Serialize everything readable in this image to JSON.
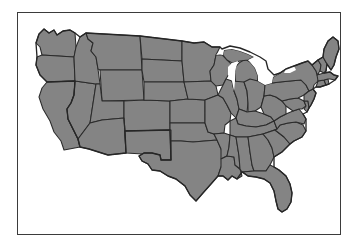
{
  "figure": {
    "kind": "map-figure",
    "background_color": "#ffffff",
    "width": 358,
    "height": 247,
    "caption": "",
    "title": ""
  },
  "frame": {
    "name": "map-border-frame",
    "border_color": "#3b3b3b",
    "border_width_px": 1.4,
    "fill_color": "#ffffff",
    "left_px": 17,
    "top_px": 12,
    "width_px": 324,
    "height_px": 223
  },
  "map": {
    "name": "united-states-map",
    "region": "Contiguous United States",
    "projection_look": "albers-like",
    "land_fill_color": "#848484",
    "state_border_color": "#2b2b2b",
    "outline_color": "#262626",
    "water_fill_color": "#ffffff",
    "labels_visible": false,
    "legend_visible": false,
    "state_count": 48,
    "states": [
      {
        "code": "WA",
        "name": "Washington"
      },
      {
        "code": "OR",
        "name": "Oregon"
      },
      {
        "code": "CA",
        "name": "California"
      },
      {
        "code": "NV",
        "name": "Nevada"
      },
      {
        "code": "ID",
        "name": "Idaho"
      },
      {
        "code": "MT",
        "name": "Montana"
      },
      {
        "code": "WY",
        "name": "Wyoming"
      },
      {
        "code": "UT",
        "name": "Utah"
      },
      {
        "code": "AZ",
        "name": "Arizona"
      },
      {
        "code": "CO",
        "name": "Colorado"
      },
      {
        "code": "NM",
        "name": "New Mexico"
      },
      {
        "code": "ND",
        "name": "North Dakota"
      },
      {
        "code": "SD",
        "name": "South Dakota"
      },
      {
        "code": "NE",
        "name": "Nebraska"
      },
      {
        "code": "KS",
        "name": "Kansas"
      },
      {
        "code": "OK",
        "name": "Oklahoma"
      },
      {
        "code": "TX",
        "name": "Texas"
      },
      {
        "code": "MN",
        "name": "Minnesota"
      },
      {
        "code": "IA",
        "name": "Iowa"
      },
      {
        "code": "MO",
        "name": "Missouri"
      },
      {
        "code": "AR",
        "name": "Arkansas"
      },
      {
        "code": "LA",
        "name": "Louisiana"
      },
      {
        "code": "WI",
        "name": "Wisconsin"
      },
      {
        "code": "IL",
        "name": "Illinois"
      },
      {
        "code": "MI",
        "name": "Michigan"
      },
      {
        "code": "IN",
        "name": "Indiana"
      },
      {
        "code": "OH",
        "name": "Ohio"
      },
      {
        "code": "KY",
        "name": "Kentucky"
      },
      {
        "code": "TN",
        "name": "Tennessee"
      },
      {
        "code": "MS",
        "name": "Mississippi"
      },
      {
        "code": "AL",
        "name": "Alabama"
      },
      {
        "code": "GA",
        "name": "Georgia"
      },
      {
        "code": "FL",
        "name": "Florida"
      },
      {
        "code": "SC",
        "name": "South Carolina"
      },
      {
        "code": "NC",
        "name": "North Carolina"
      },
      {
        "code": "VA",
        "name": "Virginia"
      },
      {
        "code": "WV",
        "name": "West Virginia"
      },
      {
        "code": "MD",
        "name": "Maryland"
      },
      {
        "code": "DE",
        "name": "Delaware"
      },
      {
        "code": "PA",
        "name": "Pennsylvania"
      },
      {
        "code": "NJ",
        "name": "New Jersey"
      },
      {
        "code": "NY",
        "name": "New York"
      },
      {
        "code": "CT",
        "name": "Connecticut"
      },
      {
        "code": "RI",
        "name": "Rhode Island"
      },
      {
        "code": "MA",
        "name": "Massachusetts"
      },
      {
        "code": "VT",
        "name": "Vermont"
      },
      {
        "code": "NH",
        "name": "New Hampshire"
      },
      {
        "code": "ME",
        "name": "Maine"
      }
    ],
    "water_bodies": [
      {
        "name": "Lake Superior"
      },
      {
        "name": "Lake Michigan"
      },
      {
        "name": "Lake Huron"
      },
      {
        "name": "Lake Erie"
      },
      {
        "name": "Lake Ontario"
      }
    ]
  }
}
